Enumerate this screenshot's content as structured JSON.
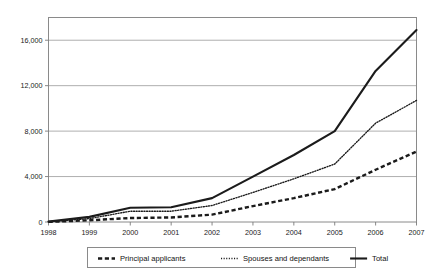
{
  "chart_data": {
    "type": "line",
    "title": "",
    "xlabel": "",
    "ylabel": "",
    "x": [
      "1998",
      "1999",
      "2000",
      "2001",
      "2002",
      "2003",
      "2004",
      "2005",
      "2006",
      "2007"
    ],
    "categories": [
      "1998",
      "1999",
      "2000",
      "2001",
      "2002",
      "2003",
      "2004",
      "2005",
      "2006",
      "2007"
    ],
    "xtick_labels": [
      "1998",
      "1999",
      "2000",
      "2001",
      "2002",
      "2003",
      "2004",
      "2005",
      "2006",
      "2007"
    ],
    "ytick_labels": [
      "0",
      "4,000",
      "8,000",
      "12,000",
      "16,000"
    ],
    "ytick_values": [
      0,
      4000,
      8000,
      12000,
      16000
    ],
    "ylim": [
      0,
      18000
    ],
    "xlim": [
      "1998",
      "2007"
    ],
    "grid": true,
    "legend_position": "bottom",
    "series": [
      {
        "name": "Principal applicants",
        "style": "dashed",
        "color": "#1b1b1b",
        "values": [
          10,
          150,
          350,
          400,
          650,
          1400,
          2100,
          2900,
          4600,
          6200
        ]
      },
      {
        "name": "Spouses and dependants",
        "style": "dotted",
        "color": "#1b1b1b",
        "values": [
          20,
          300,
          950,
          950,
          1450,
          2600,
          3800,
          5100,
          8700,
          10700
        ]
      },
      {
        "name": "Total",
        "style": "solid",
        "color": "#1b1b1b",
        "values": [
          30,
          450,
          1250,
          1300,
          2100,
          4000,
          5900,
          8000,
          13300,
          16900
        ]
      }
    ]
  },
  "legend": {
    "items": [
      {
        "label": "Principal applicants",
        "style": "dashed"
      },
      {
        "label": "Spouses and dependants",
        "style": "dotted"
      },
      {
        "label": "Total",
        "style": "solid"
      }
    ]
  },
  "colors": {
    "ink": "#1b1b1b",
    "grid": "#9a9a9a",
    "border": "#8a8a8a",
    "background": "#ffffff"
  }
}
